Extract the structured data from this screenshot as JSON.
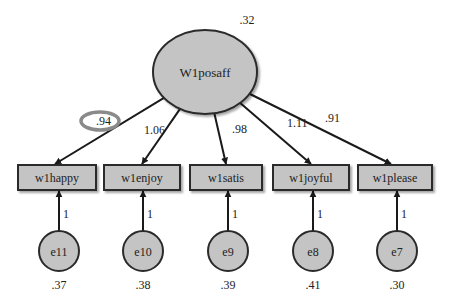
{
  "latent": {
    "label": "W1posaff",
    "variance": ".32",
    "cx": 205,
    "cy": 72,
    "rx": 52,
    "ry": 42
  },
  "colors": {
    "fill": "#c4c4c4",
    "stroke": "#2a2a2a",
    "highlight": "#8a8a8a"
  },
  "indicators": [
    {
      "label": "w1happy",
      "loading": ".94",
      "x": 18,
      "w": 78,
      "lx": 96,
      "ly": 125,
      "highlight": true
    },
    {
      "label": "w1enjoy",
      "loading": "1.06",
      "x": 104,
      "w": 76,
      "lx": 144,
      "ly": 134
    },
    {
      "label": "w1satis",
      "loading": ".98",
      "x": 190,
      "w": 72,
      "lx": 232,
      "ly": 133
    },
    {
      "label": "w1joyful",
      "loading": "1.11",
      "x": 273,
      "w": 76,
      "lx": 287,
      "ly": 127
    },
    {
      "label": "w1please",
      "loading": ".91",
      "x": 358,
      "w": 74,
      "lx": 325,
      "ly": 122
    }
  ],
  "errors": [
    {
      "label": "e11",
      "variance": ".37",
      "cx": 59,
      "path": "1"
    },
    {
      "label": "e10",
      "variance": ".38",
      "cx": 143,
      "path": "1"
    },
    {
      "label": "e9",
      "variance": ".39",
      "cx": 228,
      "path": "1"
    },
    {
      "label": "e8",
      "variance": ".41",
      "cx": 313,
      "path": "1"
    },
    {
      "label": "e7",
      "variance": ".30",
      "cx": 397,
      "path": "1"
    }
  ],
  "layout": {
    "box_y": 165,
    "box_h": 25,
    "err_cy": 251,
    "err_r": 20
  }
}
